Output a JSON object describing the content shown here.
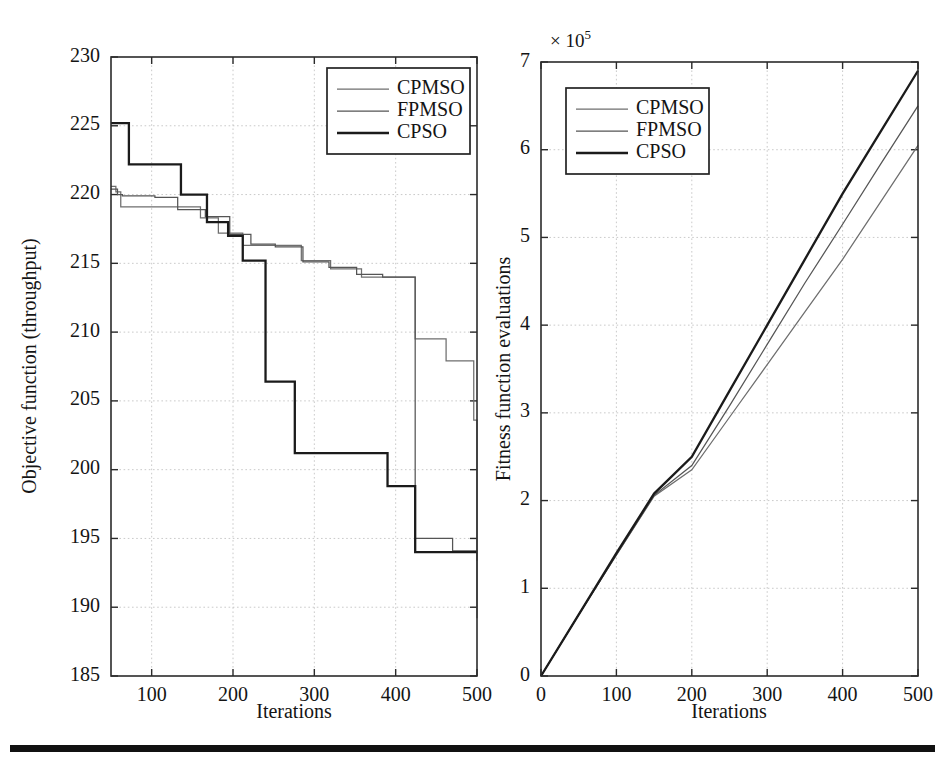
{
  "figure": {
    "panels": [
      "objective-function-panel",
      "fitness-evaluations-panel"
    ],
    "bottom_rule": true,
    "colors": {
      "cpmso": "#6e6e6e",
      "fpmso": "#555555",
      "cpso": "#1b1b1b",
      "axis": "#2b2b2b",
      "grid": "#bdbdbd",
      "background": "#ffffff"
    }
  },
  "chart_data": [
    {
      "id": "left",
      "type": "line",
      "title": "",
      "xlabel": "Iterations",
      "ylabel": "Objective function (throughput)",
      "xlim": [
        50,
        500
      ],
      "ylim": [
        185,
        230
      ],
      "xticks": [
        100,
        200,
        300,
        400,
        500
      ],
      "yticks": [
        185,
        190,
        195,
        200,
        205,
        210,
        215,
        220,
        225,
        230
      ],
      "xticklabels": [
        "100",
        "200",
        "300",
        "400",
        "500"
      ],
      "yticklabels": [
        "185",
        "190",
        "195",
        "200",
        "205",
        "210",
        "215",
        "220",
        "225",
        "230"
      ],
      "grid": true,
      "legend": [
        "CPMSO",
        "FPMSO",
        "CPSO"
      ],
      "legend_position": "upper right",
      "drawstyle": "steps-post",
      "series": [
        {
          "name": "CPMSO",
          "x": [
            50,
            56,
            62,
            110,
            128,
            160,
            182,
            212,
            246,
            284,
            320,
            358,
            392,
            424,
            462,
            488,
            496,
            500
          ],
          "values": [
            220.6,
            220.2,
            219.1,
            219.1,
            219.1,
            218.3,
            217.2,
            216.3,
            216.3,
            215.2,
            214.6,
            214.0,
            214.0,
            209.5,
            207.9,
            207.9,
            203.6,
            189.2
          ]
        },
        {
          "name": "FPMSO",
          "x": [
            50,
            58,
            64,
            104,
            132,
            166,
            196,
            222,
            252,
            286,
            318,
            352,
            384,
            416,
            424,
            470,
            492,
            500
          ],
          "values": [
            220.4,
            220.0,
            219.9,
            219.8,
            218.9,
            218.4,
            217.1,
            216.4,
            216.2,
            215.1,
            214.7,
            214.2,
            214.0,
            214.0,
            195.0,
            194.1,
            194.1,
            193.4
          ]
        },
        {
          "name": "CPSO",
          "x": [
            50,
            56,
            72,
            100,
            136,
            168,
            194,
            212,
            240,
            276,
            312,
            356,
            390,
            424,
            470,
            500
          ],
          "values": [
            225.2,
            225.2,
            222.2,
            222.2,
            220.0,
            218.0,
            217.0,
            215.2,
            206.4,
            201.2,
            201.2,
            201.2,
            198.8,
            194.0,
            194.0,
            194.0
          ]
        }
      ]
    },
    {
      "id": "right",
      "type": "line",
      "title": "",
      "xlabel": "Iterations",
      "ylabel": "Fitness function evaluations",
      "y_exponent": "× 10",
      "y_exponent_power": "5",
      "xlim": [
        0,
        500
      ],
      "ylim": [
        0,
        7
      ],
      "xticks": [
        0,
        100,
        200,
        300,
        400,
        500
      ],
      "yticks": [
        0,
        1,
        2,
        3,
        4,
        5,
        6,
        7
      ],
      "xticklabels": [
        "0",
        "100",
        "200",
        "300",
        "400",
        "500"
      ],
      "yticklabels": [
        "0",
        "1",
        "2",
        "3",
        "4",
        "5",
        "6",
        "7"
      ],
      "grid": true,
      "legend": [
        "CPMSO",
        "FPMSO",
        "CPSO"
      ],
      "legend_position": "upper left",
      "drawstyle": "default",
      "series": [
        {
          "name": "CPMSO",
          "x": [
            0,
            50,
            100,
            150,
            200,
            250,
            300,
            350,
            400,
            450,
            500
          ],
          "values": [
            0.0,
            0.7,
            1.38,
            2.05,
            2.35,
            2.95,
            3.55,
            4.15,
            4.75,
            5.4,
            6.05
          ]
        },
        {
          "name": "FPMSO",
          "x": [
            0,
            50,
            100,
            150,
            200,
            250,
            300,
            350,
            400,
            450,
            500
          ],
          "values": [
            0.0,
            0.7,
            1.38,
            2.06,
            2.4,
            3.08,
            3.78,
            4.48,
            5.15,
            5.83,
            6.5
          ]
        },
        {
          "name": "CPSO",
          "x": [
            0,
            50,
            100,
            150,
            200,
            250,
            300,
            350,
            400,
            450,
            500
          ],
          "values": [
            0.0,
            0.7,
            1.4,
            2.08,
            2.5,
            3.25,
            4.0,
            4.75,
            5.5,
            6.2,
            6.9
          ]
        }
      ]
    }
  ]
}
